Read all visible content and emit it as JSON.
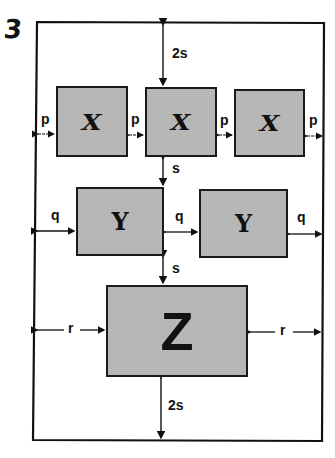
{
  "figure_number": "3",
  "boxes": {
    "x_label": "X",
    "y_label": "Y",
    "z_label": "Z"
  },
  "dimensions": {
    "top_margin": "2s",
    "bottom_margin": "2s",
    "row_gap": "s",
    "x_spacing": "p",
    "y_spacing": "q",
    "z_spacing": "r"
  },
  "colors": {
    "box_fill": "#cfcfcf",
    "stroke": "#1a1a1a",
    "background": "#ffffff"
  }
}
